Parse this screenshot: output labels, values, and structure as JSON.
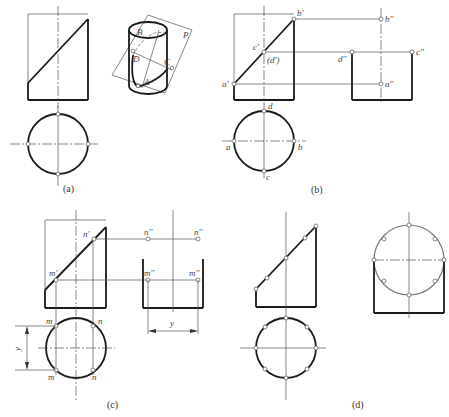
{
  "figure": {
    "panels": [
      {
        "id": "a",
        "caption": "(a)",
        "iso_labels": [
          "A",
          "B",
          "C",
          "D",
          "P"
        ]
      },
      {
        "id": "b",
        "caption": "(b)",
        "front_labels": [
          "b'",
          "c'",
          "(d')",
          "a'"
        ],
        "side_labels": [
          "b''",
          "d''",
          "c''",
          "a''"
        ],
        "top_labels": [
          "d",
          "a",
          "b",
          "c"
        ]
      },
      {
        "id": "c",
        "caption": "(c)",
        "front_labels": [
          "n'",
          "m'"
        ],
        "side_labels": [
          "n''",
          "n''",
          "m''",
          "m''"
        ],
        "top_labels": [
          "m",
          "n",
          "m",
          "n"
        ],
        "dimension_label": "y"
      },
      {
        "id": "d",
        "caption": "(d)"
      }
    ]
  },
  "colors": {
    "line": "#1a1a1a",
    "thin": "#555555",
    "background": "#ffffff"
  }
}
